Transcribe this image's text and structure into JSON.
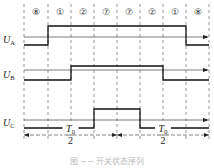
{
  "diagram": {
    "type": "switching-state timing diagram",
    "segments": [
      "⑧",
      "①",
      "②",
      "⑦",
      "⑦",
      "②",
      "①",
      "⑧"
    ],
    "boundaries_x": [
      24,
      48,
      71,
      94,
      117,
      140,
      163,
      186,
      209
    ],
    "signals": [
      {
        "name": "U",
        "sub": "A",
        "high": [
          1,
          2,
          3,
          4,
          5,
          6
        ]
      },
      {
        "name": "U",
        "sub": "B",
        "high": [
          2,
          3,
          4,
          5
        ]
      },
      {
        "name": "U",
        "sub": "C",
        "high": [
          3,
          4
        ]
      }
    ],
    "period_labels": [
      {
        "num": "T",
        "numsub": "0",
        "den": "2"
      },
      {
        "num": "T",
        "numsub": "0",
        "den": "2"
      }
    ],
    "caption": "图 ─ ─ 开关状态序列"
  }
}
